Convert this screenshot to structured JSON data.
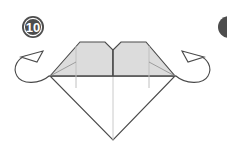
{
  "diagram": {
    "kind": "origami-fold-instruction",
    "background_color": "#ffffff",
    "step_badge": {
      "label": "10",
      "shape": "filled-circle",
      "fill_color": "#4d4d4d",
      "ring_color": "#ffffff",
      "text_color": "#ffffff",
      "center_x": 33,
      "center_y": 27,
      "radius": 11
    },
    "next_step_badge": {
      "label": "",
      "shape": "filled-circle-clipped",
      "fill_color": "#4d4d4d",
      "center_x": 229,
      "center_y": 27,
      "radius": 11,
      "note": "partially visible at right edge"
    },
    "model": {
      "name": "diamond-heart-shape",
      "outline_color": "#4a4a4a",
      "outline_width": 1.1,
      "shaded_fill": "#dcdcdc",
      "white_fill": "#ffffff",
      "crease_color": "#b9b9b9",
      "vertices": {
        "left_point": [
          50,
          76
        ],
        "right_point": [
          175,
          76
        ],
        "bottom_point": [
          113,
          140
        ],
        "center_notch": [
          113,
          50
        ],
        "left_lobe_top_left": [
          80,
          42
        ],
        "left_lobe_top_right": [
          105,
          42
        ],
        "right_lobe_top_left": [
          121,
          42
        ],
        "right_lobe_top_right": [
          146,
          42
        ],
        "left_crease_x": 76,
        "right_crease_x": 149
      }
    },
    "arrows": [
      {
        "name": "fold-back-arrow-left",
        "direction": "counter-clockwise-loop-up-left",
        "head_style": "open-triangle",
        "stroke_color": "#4a4a4a",
        "stroke_width": 1.1,
        "anchor_x": 50,
        "anchor_y": 76
      },
      {
        "name": "fold-back-arrow-right",
        "direction": "clockwise-loop-up-right",
        "head_style": "open-triangle",
        "stroke_color": "#4a4a4a",
        "stroke_width": 1.1,
        "anchor_x": 175,
        "anchor_y": 76
      }
    ]
  }
}
